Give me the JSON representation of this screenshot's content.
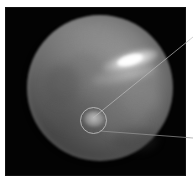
{
  "figure": {
    "panel": {
      "background_color": "#030303",
      "frame_color": "#ffffff"
    },
    "caption": {
      "text": "",
      "note": "caption-clipped"
    },
    "annotations": {
      "circle_label": "circled-feature",
      "plume_label": "bright-plume",
      "leader_top_label": "leader-line-upper",
      "leader_bottom_label": "leader-line-lower"
    }
  },
  "chart_data": {
    "type": "heatmap",
    "title": "",
    "subtitle": "",
    "xlabel": "",
    "ylabel": "",
    "grid": false,
    "legend_position": "none",
    "colormap": "grayscale",
    "value_range": [
      0,
      255
    ],
    "axis_ranges": {
      "x": [
        0,
        181
      ],
      "y": [
        0,
        169
      ]
    },
    "features": [
      {
        "name": "planetary-disk",
        "shape": "circle",
        "center_x": 95,
        "center_y": 81,
        "radius": 73,
        "peak_brightness": 168,
        "edge_brightness": 10
      },
      {
        "name": "bright-plume",
        "shape": "ellipse",
        "center_x": 125,
        "center_y": 54,
        "semi_major": 29,
        "semi_minor": 10,
        "rotation_deg": -16,
        "peak_brightness": 255
      },
      {
        "name": "plume-tail",
        "shape": "ellipse",
        "center_x": 119,
        "center_y": 68,
        "semi_major": 33,
        "semi_minor": 8,
        "rotation_deg": -12,
        "peak_brightness": 210
      },
      {
        "name": "circled-spot",
        "shape": "ellipse",
        "center_x": 89,
        "center_y": 112,
        "semi_major": 10,
        "semi_minor": 8,
        "peak_brightness": 196
      }
    ],
    "overlays": [
      {
        "name": "annotation-circle",
        "type": "circle",
        "center_x": 88,
        "center_y": 114,
        "radius": 13,
        "stroke": "#c8c8c8",
        "stroke_width": 1
      },
      {
        "name": "leader-line-upper",
        "type": "line",
        "x1": 93,
        "y1": 118,
        "x2": 193,
        "y2": 37,
        "stroke": "#bdbdbd",
        "stroke_width": 0.7
      },
      {
        "name": "leader-line-lower",
        "type": "line",
        "x1": 100,
        "y1": 131,
        "x2": 193,
        "y2": 138,
        "stroke": "#9a9a9a",
        "stroke_width": 0.7
      }
    ]
  }
}
